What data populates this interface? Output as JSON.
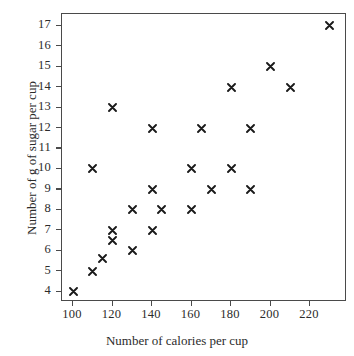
{
  "chart_data": {
    "type": "scatter",
    "title": "",
    "xlabel": "Number of calories per cup",
    "ylabel": "Number of g of sugar per cup",
    "xlim": [
      94,
      238
    ],
    "ylim": [
      3.3,
      17.6
    ],
    "xticks": [
      100,
      120,
      140,
      160,
      180,
      200,
      220
    ],
    "yticks": [
      4,
      5,
      6,
      7,
      8,
      9,
      10,
      11,
      12,
      13,
      14,
      15,
      16,
      17
    ],
    "xtick_labels": [
      "100",
      "120",
      "140",
      "160",
      "180",
      "200",
      "220"
    ],
    "ytick_labels": [
      "4",
      "5",
      "6",
      "7",
      "8",
      "9",
      "10",
      "11",
      "12",
      "13",
      "14",
      "15",
      "16",
      "17"
    ],
    "grid": false,
    "legend": null,
    "marker": "x",
    "marker_color": "#1a1a1a",
    "points": [
      {
        "x": 100,
        "y": 4
      },
      {
        "x": 110,
        "y": 5
      },
      {
        "x": 110,
        "y": 10
      },
      {
        "x": 115,
        "y": 5.6
      },
      {
        "x": 120,
        "y": 6.5
      },
      {
        "x": 120,
        "y": 7
      },
      {
        "x": 120,
        "y": 13
      },
      {
        "x": 130,
        "y": 6
      },
      {
        "x": 130,
        "y": 8
      },
      {
        "x": 140,
        "y": 7
      },
      {
        "x": 140,
        "y": 9
      },
      {
        "x": 140,
        "y": 12
      },
      {
        "x": 145,
        "y": 8
      },
      {
        "x": 160,
        "y": 8
      },
      {
        "x": 160,
        "y": 10
      },
      {
        "x": 165,
        "y": 12
      },
      {
        "x": 170,
        "y": 9
      },
      {
        "x": 180,
        "y": 10
      },
      {
        "x": 180,
        "y": 14
      },
      {
        "x": 190,
        "y": 9
      },
      {
        "x": 190,
        "y": 12
      },
      {
        "x": 200,
        "y": 15
      },
      {
        "x": 210,
        "y": 14
      },
      {
        "x": 230,
        "y": 17
      }
    ]
  },
  "colors": {
    "axis": "#4a4a4a",
    "marker": "#1a1a1a",
    "text": "#2b2b2b",
    "background": "#ffffff"
  }
}
